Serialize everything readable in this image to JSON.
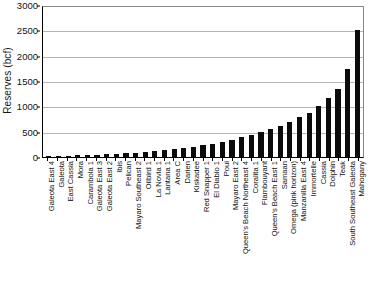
{
  "chart_data": {
    "type": "bar",
    "title": "",
    "subtitle": "",
    "xlabel": "",
    "ylabel": "Reserves (bcf)",
    "ylim": [
      0,
      3000
    ],
    "ytick_labels": [
      "0",
      "500",
      "1000",
      "1500",
      "2000",
      "2500",
      "3000"
    ],
    "yticks": [
      0,
      500,
      1000,
      1500,
      2000,
      2500,
      3000
    ],
    "grid": true,
    "legend": "none",
    "bar_color": "#0b0b0b",
    "background_color": "#ffffff",
    "gridline_color": "#b4b4b4",
    "categories": [
      "Galeota East 4",
      "Galeota",
      "East Cassia",
      "Mora",
      "Carambola 1",
      "Galeota East 3",
      "Galeota East 2",
      "Ibis",
      "Pelican",
      "Mayaro Southeast 2",
      "Oilbird 1",
      "La Novia 1",
      "Lantana 1",
      "Area C",
      "Darien",
      "Kiskadee",
      "Red Snapper 1",
      "El Diablo 1",
      "Poui",
      "Mayaro East 2",
      "Queen's Beach Northeast 4",
      "Coralita 1",
      "Flambouyant",
      "Queen's Beach East 1",
      "Samaan",
      "Omega (pink horizon)",
      "Manzanilla East 4",
      "Immortelle",
      "Cassia",
      "Dolphin",
      "Teak",
      "South Southeast Galeota",
      "Mahogany"
    ],
    "values": [
      15,
      20,
      25,
      30,
      40,
      45,
      50,
      55,
      70,
      80,
      95,
      110,
      130,
      150,
      175,
      200,
      230,
      260,
      300,
      340,
      390,
      440,
      500,
      560,
      620,
      700,
      790,
      870,
      1000,
      1160,
      1340,
      1730,
      2500
    ]
  }
}
